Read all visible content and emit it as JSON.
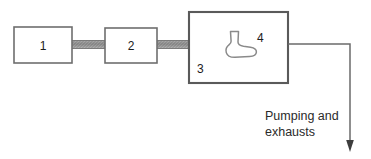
{
  "diagram": {
    "title": "",
    "type": "process-flow-schematic",
    "colors": {
      "background": "#ffffff",
      "box_stroke": "#6e6e6e",
      "chamber_stroke": "#5a5a5a",
      "vessel_stroke": "#8a8a8a",
      "line_stroke": "#6b6b6b",
      "arrow_fill": "#3d3d3d",
      "label_text": "#1c1c1c",
      "caption_text": "#2a2a2a",
      "connector_gray": "#8c8c8c"
    },
    "boxes": [
      {
        "id": "box-1",
        "label": "1",
        "x": 14,
        "y": 27,
        "width": 58,
        "height": 36
      },
      {
        "id": "box-2",
        "label": "2",
        "x": 105,
        "y": 28,
        "width": 52,
        "height": 35
      }
    ],
    "chamber": {
      "id": "chamber-3",
      "label": "3",
      "x": 189,
      "y": 12,
      "width": 99,
      "height": 71,
      "label_x": 197,
      "label_y": 73
    },
    "vessel": {
      "id": "vessel-4",
      "label": "4",
      "label_x": 257,
      "label_y": 42
    },
    "connectors": [
      {
        "id": "connector-1-2",
        "x": 72,
        "y": 40,
        "width": 33,
        "height": 9
      },
      {
        "id": "connector-2-3",
        "x": 157,
        "y": 40,
        "width": 33,
        "height": 9
      }
    ],
    "exhaust": {
      "caption_line_1": "Pumping and",
      "caption_line_2": "exhausts",
      "caption_x": 265,
      "caption_line_1_y": 120,
      "caption_line_2_y": 136,
      "path": "M 288 44 L 350 44 L 350 142",
      "arrow_points": "350,152 346,140 354,140"
    }
  }
}
